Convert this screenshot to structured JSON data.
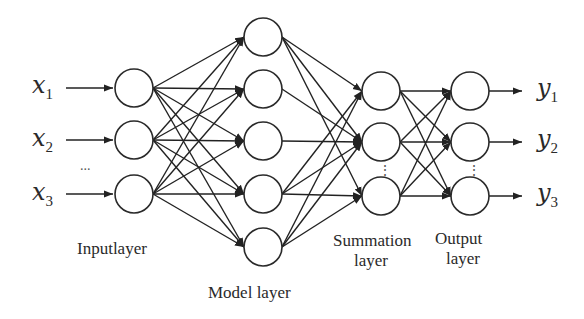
{
  "diagram": {
    "type": "neural-network",
    "colors": {
      "stroke": "#2a2a2a",
      "background": "#ffffff"
    },
    "inputs": [
      {
        "var": "x",
        "sub": "1"
      },
      {
        "var": "x",
        "sub": "2"
      },
      {
        "var": "x",
        "sub": "3"
      }
    ],
    "outputs": [
      {
        "var": "y",
        "sub": "1"
      },
      {
        "var": "y",
        "sub": "2"
      },
      {
        "var": "y",
        "sub": "3"
      }
    ],
    "ellipsis_inputs": "...",
    "vertical_ellipsis": "⋮",
    "layers": {
      "input": {
        "label": "Inputlayer",
        "nodes": 3
      },
      "model": {
        "label": "Model layer",
        "nodes": 5
      },
      "summation": {
        "label_line1": "Summation",
        "label_line2": "layer",
        "nodes": 3
      },
      "output": {
        "label_line1": "Output",
        "label_line2": "layer",
        "nodes": 3
      }
    },
    "connections": {
      "input_to_model": "fully-connected",
      "model_to_summation": [
        [
          1,
          1
        ],
        [
          1,
          2
        ],
        [
          1,
          3
        ],
        [
          2,
          2
        ],
        [
          3,
          2
        ],
        [
          4,
          1
        ],
        [
          4,
          2
        ],
        [
          4,
          3
        ],
        [
          5,
          1
        ],
        [
          5,
          2
        ],
        [
          5,
          3
        ]
      ],
      "summation_to_output": "fully-connected"
    }
  }
}
